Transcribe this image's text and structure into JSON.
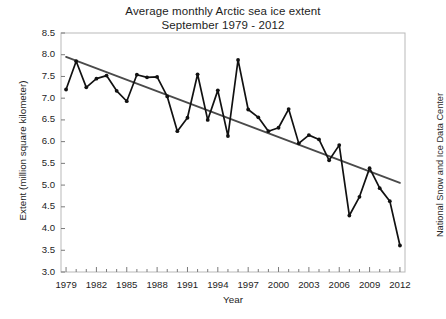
{
  "chart_data": {
    "type": "line",
    "title": "Average monthly Arctic sea ice extent",
    "subtitle": "September 1979 - 2012",
    "xlabel": "Year",
    "ylabel": "Extent (million square kilometer)",
    "credit": "National Snow and Ice Data Center",
    "xlim": [
      1978.5,
      2012.5
    ],
    "ylim": [
      3.0,
      8.5
    ],
    "y_ticks": [
      3.0,
      3.5,
      4.0,
      4.5,
      5.0,
      5.5,
      6.0,
      6.5,
      7.0,
      7.5,
      8.0,
      8.5
    ],
    "y_tick_labels": [
      "3.0",
      "3.5",
      "4.0",
      "4.5",
      "5.0",
      "5.5",
      "6.0",
      "6.5",
      "7.0",
      "7.5",
      "8.0",
      "8.5"
    ],
    "x_ticks": [
      1979,
      1982,
      1985,
      1988,
      1991,
      1994,
      1997,
      2000,
      2003,
      2006,
      2009,
      2012
    ],
    "x_tick_labels": [
      "1979",
      "1982",
      "1985",
      "1988",
      "1991",
      "1994",
      "1997",
      "2000",
      "2003",
      "2006",
      "2009",
      "2012"
    ],
    "x_minor_tick_interval": 1,
    "grid": false,
    "legend": "none",
    "series": [
      {
        "name": "September Arctic sea ice extent",
        "style": "line-with-markers",
        "color": "#111111",
        "x": [
          1979,
          1980,
          1981,
          1982,
          1983,
          1984,
          1985,
          1986,
          1987,
          1988,
          1989,
          1990,
          1991,
          1992,
          1993,
          1994,
          1995,
          1996,
          1997,
          1998,
          1999,
          2000,
          2001,
          2002,
          2003,
          2004,
          2005,
          2006,
          2007,
          2008,
          2009,
          2010,
          2011,
          2012
        ],
        "values": [
          7.2,
          7.85,
          7.25,
          7.45,
          7.52,
          7.17,
          6.93,
          7.54,
          7.48,
          7.49,
          7.04,
          6.24,
          6.55,
          7.55,
          6.5,
          7.18,
          6.13,
          7.88,
          6.74,
          6.56,
          6.24,
          6.32,
          6.75,
          5.96,
          6.15,
          6.05,
          5.57,
          5.92,
          4.3,
          4.73,
          5.39,
          4.93,
          4.63,
          3.61
        ]
      }
    ],
    "trend_line": {
      "name": "Linear trend",
      "color": "#4a4a4a",
      "x_start": 1979,
      "y_start": 7.95,
      "x_end": 2012,
      "y_end": 5.05
    }
  }
}
